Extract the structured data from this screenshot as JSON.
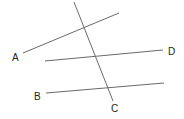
{
  "diagram": {
    "type": "geometry-lines",
    "lines": [
      {
        "id": "transversal",
        "x1": 74,
        "y1": 2,
        "x2": 113,
        "y2": 101
      },
      {
        "id": "line-a",
        "x1": 23,
        "y1": 53,
        "x2": 119,
        "y2": 13
      },
      {
        "id": "line-d",
        "x1": 45,
        "y1": 61,
        "x2": 163,
        "y2": 50
      },
      {
        "id": "line-b",
        "x1": 46,
        "y1": 93,
        "x2": 164,
        "y2": 83
      }
    ],
    "labels": [
      {
        "text": "A",
        "x": 12,
        "y": 61
      },
      {
        "text": "D",
        "x": 168,
        "y": 55
      },
      {
        "text": "B",
        "x": 34,
        "y": 100
      },
      {
        "text": "C",
        "x": 111,
        "y": 112
      }
    ],
    "line_color": "#6a6a6a",
    "label_color": "#222222"
  }
}
